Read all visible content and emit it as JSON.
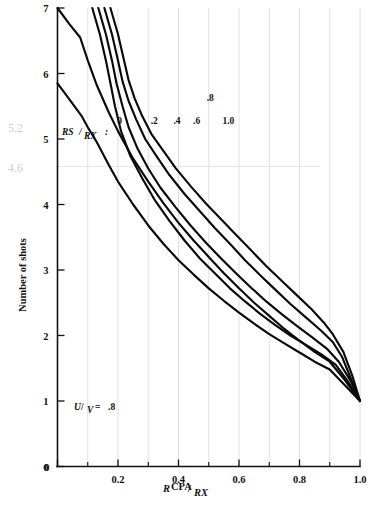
{
  "chart_data": {
    "type": "line",
    "title": "",
    "xlabel": "R CPA/RX",
    "xlabel_parts": {
      "numerator": "R",
      "numerator_sub": "CPA",
      "denominator": "RX"
    },
    "ylabel": "Number of shots",
    "xlim": [
      0,
      1.0
    ],
    "ylim": [
      0,
      7
    ],
    "xticks": [
      0,
      0.2,
      0.4,
      0.6,
      0.8,
      1.0
    ],
    "xtick_labels": [
      "0",
      "0.2",
      "0.4",
      "0.6",
      "0.8",
      "1.0"
    ],
    "xticks_minor": [
      0.1,
      0.3,
      0.5,
      0.7,
      0.9
    ],
    "yticks": [
      0,
      1,
      2,
      3,
      4,
      5,
      6,
      7
    ],
    "ytick_labels": [
      "0",
      "1",
      "2",
      "3",
      "4",
      "5",
      "6",
      "7"
    ],
    "grid": "vertical-light",
    "legend_position": "inline-curve-labels",
    "legend_title": "RS/RX:",
    "legend_title_parts": {
      "numerator": "RS",
      "denominator": "RX"
    },
    "parameter_annotation": "U/V = .8",
    "parameter_parts": {
      "numerator": "U",
      "denominator": "V",
      "value": ".8"
    },
    "series": [
      {
        "name": "0",
        "label": "0",
        "label_x": 0.205,
        "label_y": 5.28,
        "points": [
          [
            0.0,
            7.0
          ],
          [
            0.04,
            6.75
          ],
          [
            0.075,
            6.55
          ],
          [
            0.1,
            6.2
          ],
          [
            0.13,
            5.82
          ],
          [
            0.17,
            5.4
          ],
          [
            0.2,
            5.12
          ],
          [
            0.25,
            4.7
          ],
          [
            0.3,
            4.35
          ],
          [
            0.35,
            4.02
          ],
          [
            0.4,
            3.72
          ],
          [
            0.45,
            3.45
          ],
          [
            0.5,
            3.2
          ],
          [
            0.55,
            2.95
          ],
          [
            0.6,
            2.72
          ],
          [
            0.65,
            2.5
          ],
          [
            0.7,
            2.3
          ],
          [
            0.75,
            2.1
          ],
          [
            0.8,
            1.92
          ],
          [
            0.85,
            1.75
          ],
          [
            0.9,
            1.6
          ],
          [
            0.95,
            1.32
          ],
          [
            1.0,
            1.0
          ]
        ]
      },
      {
        "name": "0.2",
        "label": ".2",
        "label_x": 0.32,
        "label_y": 5.28,
        "points": [
          [
            0.0,
            5.85
          ],
          [
            0.04,
            5.6
          ],
          [
            0.08,
            5.35
          ],
          [
            0.1,
            5.18
          ],
          [
            0.13,
            4.95
          ],
          [
            0.17,
            4.6
          ],
          [
            0.2,
            4.35
          ],
          [
            0.25,
            4.0
          ],
          [
            0.3,
            3.68
          ],
          [
            0.35,
            3.4
          ],
          [
            0.4,
            3.15
          ],
          [
            0.45,
            2.93
          ],
          [
            0.5,
            2.72
          ],
          [
            0.55,
            2.53
          ],
          [
            0.6,
            2.35
          ],
          [
            0.65,
            2.18
          ],
          [
            0.7,
            2.02
          ],
          [
            0.75,
            1.88
          ],
          [
            0.8,
            1.74
          ],
          [
            0.85,
            1.6
          ],
          [
            0.9,
            1.48
          ],
          [
            0.95,
            1.24
          ],
          [
            1.0,
            1.0
          ]
        ]
      },
      {
        "name": "0.4",
        "label": ".4",
        "label_x": 0.395,
        "label_y": 5.28,
        "points": [
          [
            0.115,
            7.0
          ],
          [
            0.14,
            6.6
          ],
          [
            0.16,
            6.2
          ],
          [
            0.175,
            5.85
          ],
          [
            0.19,
            5.5
          ],
          [
            0.21,
            5.12
          ],
          [
            0.24,
            4.75
          ],
          [
            0.28,
            4.4
          ],
          [
            0.32,
            4.08
          ],
          [
            0.37,
            3.75
          ],
          [
            0.42,
            3.45
          ],
          [
            0.47,
            3.18
          ],
          [
            0.52,
            2.95
          ],
          [
            0.57,
            2.72
          ],
          [
            0.62,
            2.52
          ],
          [
            0.67,
            2.33
          ],
          [
            0.72,
            2.16
          ],
          [
            0.77,
            2.0
          ],
          [
            0.82,
            1.86
          ],
          [
            0.87,
            1.72
          ],
          [
            0.92,
            1.55
          ],
          [
            0.96,
            1.3
          ],
          [
            1.0,
            1.0
          ]
        ]
      },
      {
        "name": "0.6",
        "label": ".6",
        "label_x": 0.46,
        "label_y": 5.28,
        "points": [
          [
            0.135,
            7.0
          ],
          [
            0.16,
            6.6
          ],
          [
            0.18,
            6.2
          ],
          [
            0.195,
            5.85
          ],
          [
            0.215,
            5.5
          ],
          [
            0.235,
            5.18
          ],
          [
            0.265,
            4.85
          ],
          [
            0.3,
            4.55
          ],
          [
            0.34,
            4.26
          ],
          [
            0.39,
            3.96
          ],
          [
            0.44,
            3.68
          ],
          [
            0.49,
            3.42
          ],
          [
            0.54,
            3.18
          ],
          [
            0.59,
            2.95
          ],
          [
            0.64,
            2.73
          ],
          [
            0.69,
            2.52
          ],
          [
            0.74,
            2.33
          ],
          [
            0.79,
            2.15
          ],
          [
            0.84,
            1.98
          ],
          [
            0.89,
            1.8
          ],
          [
            0.93,
            1.6
          ],
          [
            0.97,
            1.3
          ],
          [
            1.0,
            1.0
          ]
        ]
      },
      {
        "name": "0.8",
        "label": ".8",
        "label_x": 0.505,
        "label_y": 5.62,
        "points": [
          [
            0.155,
            7.0
          ],
          [
            0.18,
            6.6
          ],
          [
            0.2,
            6.2
          ],
          [
            0.215,
            5.88
          ],
          [
            0.235,
            5.58
          ],
          [
            0.26,
            5.3
          ],
          [
            0.29,
            5.0
          ],
          [
            0.33,
            4.72
          ],
          [
            0.37,
            4.45
          ],
          [
            0.42,
            4.16
          ],
          [
            0.47,
            3.9
          ],
          [
            0.52,
            3.64
          ],
          [
            0.57,
            3.4
          ],
          [
            0.62,
            3.15
          ],
          [
            0.67,
            2.92
          ],
          [
            0.72,
            2.7
          ],
          [
            0.77,
            2.48
          ],
          [
            0.82,
            2.28
          ],
          [
            0.87,
            2.08
          ],
          [
            0.91,
            1.9
          ],
          [
            0.94,
            1.68
          ],
          [
            0.97,
            1.34
          ],
          [
            1.0,
            1.0
          ]
        ]
      },
      {
        "name": "1.0",
        "label": "1.0",
        "label_x": 0.565,
        "label_y": 5.28,
        "points": [
          [
            0.175,
            7.0
          ],
          [
            0.2,
            6.6
          ],
          [
            0.22,
            6.2
          ],
          [
            0.235,
            5.9
          ],
          [
            0.255,
            5.62
          ],
          [
            0.28,
            5.35
          ],
          [
            0.31,
            5.08
          ],
          [
            0.35,
            4.82
          ],
          [
            0.39,
            4.56
          ],
          [
            0.44,
            4.28
          ],
          [
            0.49,
            4.02
          ],
          [
            0.54,
            3.78
          ],
          [
            0.59,
            3.54
          ],
          [
            0.64,
            3.3
          ],
          [
            0.69,
            3.06
          ],
          [
            0.74,
            2.84
          ],
          [
            0.79,
            2.62
          ],
          [
            0.84,
            2.4
          ],
          [
            0.88,
            2.2
          ],
          [
            0.91,
            2.02
          ],
          [
            0.945,
            1.75
          ],
          [
            0.975,
            1.38
          ],
          [
            1.0,
            1.0
          ]
        ]
      }
    ],
    "handwritten_annotations": [
      {
        "text": "5.2",
        "x_px": 8,
        "y_px": 132
      },
      {
        "text": "4.6",
        "x_px": 8,
        "y_px": 172
      }
    ],
    "annotation_gridlines_y": [
      4.58
    ]
  }
}
